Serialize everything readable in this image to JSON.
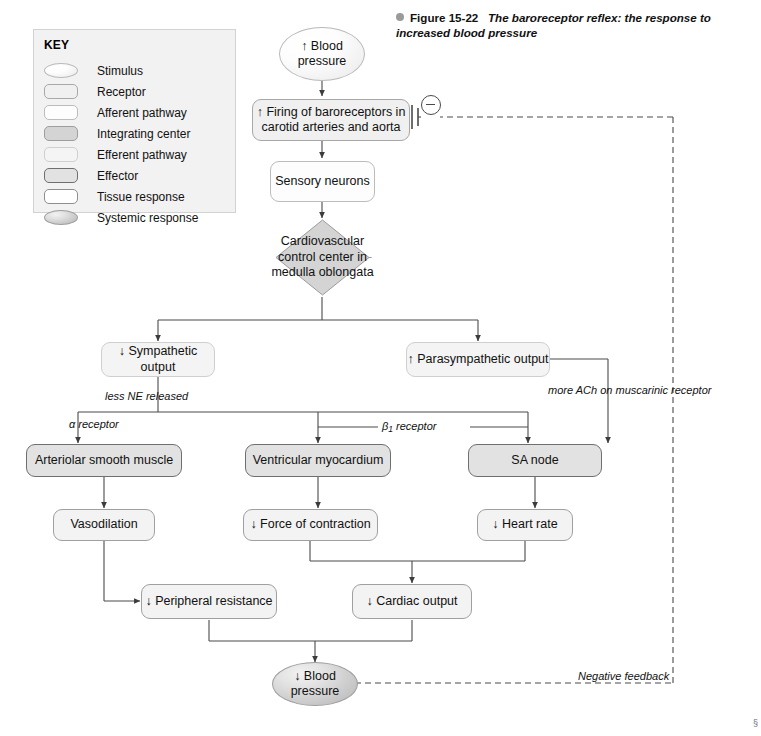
{
  "figure": {
    "bullet_icon": "bullet-dot-icon",
    "number": "Figure 15-22",
    "caption": "The baroreceptor reflex: the response to increased blood pressure",
    "corner_mark": "§"
  },
  "key": {
    "title": "KEY",
    "items": [
      {
        "label": "Stimulus",
        "shape": "oval",
        "style": "stimulus"
      },
      {
        "label": "Receptor",
        "shape": "rect",
        "style": "receptor"
      },
      {
        "label": "Afferent pathway",
        "shape": "rect",
        "style": "afferent"
      },
      {
        "label": "Integrating center",
        "shape": "rect",
        "style": "integrating-swatch"
      },
      {
        "label": "Efferent pathway",
        "shape": "rect",
        "style": "efferent"
      },
      {
        "label": "Effector",
        "shape": "rect",
        "style": "effector"
      },
      {
        "label": "Tissue response",
        "shape": "rect",
        "style": "tissue"
      },
      {
        "label": "Systemic response",
        "shape": "oval",
        "style": "systemic"
      }
    ]
  },
  "nodes": {
    "blood_pressure_up": {
      "line1": "↑ Blood",
      "line2": "pressure"
    },
    "baroreceptor_firing": {
      "line1": "↑ Firing of baroreceptors in",
      "line2": "carotid arteries and aorta"
    },
    "sensory_neurons": {
      "line1": "Sensory neurons"
    },
    "cv_control_center": {
      "line1": "Cardiovascular",
      "line2": "control center",
      "line3": "in medulla",
      "line4": "oblongata"
    },
    "sympathetic_output": {
      "line1": "↓ Sympathetic output"
    },
    "parasympathetic_output": {
      "line1": "↑ Parasympathetic output"
    },
    "arteriolar_smooth_muscle": {
      "line1": "Arteriolar smooth muscle"
    },
    "ventricular_myocardium": {
      "line1": "Ventricular myocardium"
    },
    "sa_node": {
      "line1": "SA node"
    },
    "vasodilation": {
      "line1": "Vasodilation"
    },
    "force_of_contraction": {
      "line1": "↓ Force of contraction"
    },
    "heart_rate": {
      "line1": "↓ Heart rate"
    },
    "peripheral_resistance": {
      "line1": "↓ Peripheral resistance"
    },
    "cardiac_output": {
      "line1": "↓ Cardiac output"
    },
    "blood_pressure_down": {
      "line1": "↓ Blood",
      "line2": "pressure"
    }
  },
  "edge_labels": {
    "less_ne": "less NE released",
    "more_ach_l1": "more ACh on",
    "more_ach_l2": "muscarinic receptor",
    "alpha_receptor": "α receptor",
    "beta1_receptor_pre": "β",
    "beta1_receptor_sub": "1",
    "beta1_receptor_post": " receptor",
    "negative_feedback_l1": "Negative",
    "negative_feedback_l2": "feedback",
    "inhibition_symbol": "−"
  },
  "colors": {
    "page_bg": "#ffffff",
    "key_bg": "#f2f2f2",
    "line": "#4a4a4a",
    "effector_border": "#6f6f6f",
    "integrating_fill": "#d4d4d4",
    "systemic_fill": "#c9c9c9"
  }
}
